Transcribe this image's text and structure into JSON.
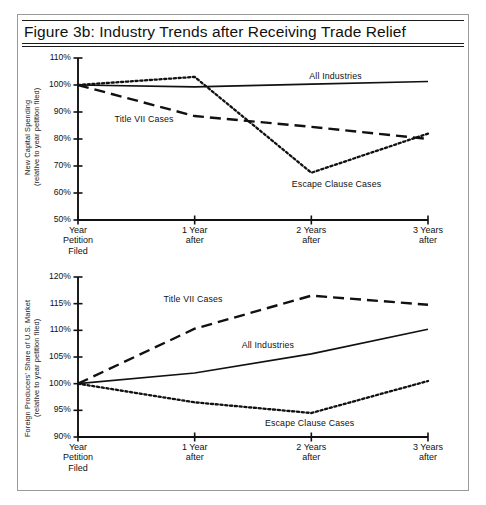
{
  "figure": {
    "title": "Figure 3b:  Industry Trends after Receiving Trade Relief"
  },
  "chart_data": [
    {
      "id": "new-capital-spending",
      "type": "line",
      "title": "",
      "xlabel": "",
      "ylabel": "New Capital Spending\n(relative to year petition filed)",
      "categories": [
        "Year\nPetition\nFiled",
        "1 Year\nafter",
        "2 Years\nafter",
        "3 Years\nafter"
      ],
      "x": [
        0,
        1,
        2,
        3
      ],
      "ylim": [
        50,
        110
      ],
      "yticks": [
        110,
        100,
        90,
        80,
        70,
        60,
        50
      ],
      "ytick_labels": [
        "110%",
        "100%",
        "90%",
        "80%",
        "70%",
        "60%",
        "50%"
      ],
      "grid": false,
      "legend": "inline-annotations",
      "series": [
        {
          "name": "All Industries",
          "style": "solid",
          "values": [
            100,
            99.3,
            100.3,
            101.3
          ],
          "label_x": 2.0,
          "label_y": 103.5
        },
        {
          "name": "Title VII Cases",
          "style": "dashed",
          "values": [
            100,
            88.5,
            84.5,
            80.0
          ],
          "label_x": 0.33,
          "label_y": 87.5
        },
        {
          "name": "Escape Clause Cases",
          "style": "dotted",
          "values": [
            100,
            103.0,
            67.5,
            82.0
          ],
          "label_x": 1.85,
          "label_y": 63.5
        }
      ]
    },
    {
      "id": "foreign-producers-share",
      "type": "line",
      "title": "",
      "xlabel": "",
      "ylabel": "Foreign Producers' Share of U.S. Market\n(relative to year petition filed)",
      "categories": [
        "Year\nPetition\nFiled",
        "1 Year\nafter",
        "2 Years\nafter",
        "3 Years\nafter"
      ],
      "x": [
        0,
        1,
        2,
        3
      ],
      "ylim": [
        90,
        120
      ],
      "yticks": [
        120,
        115,
        110,
        105,
        100,
        95,
        90
      ],
      "ytick_labels": [
        "120%",
        "115%",
        "110%",
        "105%",
        "100%",
        "95%",
        "90%"
      ],
      "grid": false,
      "legend": "inline-annotations",
      "series": [
        {
          "name": "Title VII Cases",
          "style": "dashed",
          "values": [
            100,
            110.3,
            116.5,
            114.8
          ],
          "label_x": 0.75,
          "label_y": 115.8
        },
        {
          "name": "All Industries",
          "style": "solid",
          "values": [
            100,
            102.0,
            105.6,
            110.2
          ],
          "label_x": 1.42,
          "label_y": 107.3
        },
        {
          "name": "Escape Clause Cases",
          "style": "dotted",
          "values": [
            100,
            96.5,
            94.5,
            100.5
          ],
          "label_x": 1.62,
          "label_y": 92.6
        }
      ]
    }
  ],
  "colors": {
    "ink": "#111111",
    "frame": "#9a9a9a",
    "background": "#ffffff"
  }
}
